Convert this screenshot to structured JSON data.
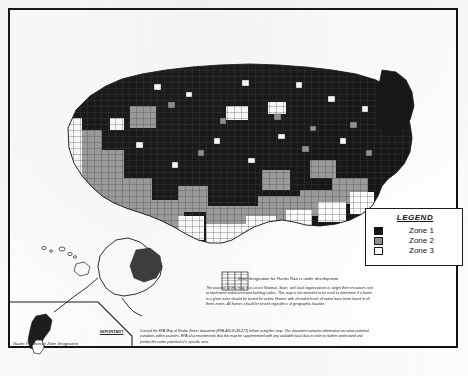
{
  "document": {
    "kind": "scanned-map-page",
    "title_visible": false
  },
  "legend": {
    "title": "LEGEND",
    "entries": [
      {
        "label": "Zone 1",
        "swatch": "black",
        "color": "#141414"
      },
      {
        "label": "Zone 2",
        "swatch": "gray",
        "color": "#8e8e8e"
      },
      {
        "label": "Zone 3",
        "swatch": "white",
        "color": "#ffffff"
      }
    ]
  },
  "annotations": {
    "puerto_rico_note": "Zone designation for Puerto Rico is under development",
    "purpose": "The purpose of this map is to assist National, State, and local organizations to target their resources and to implement radon-resistant building codes. This map is not intended to be used to determine if a home in a given zone should be tested for radon. Homes with elevated levels of radon have been found in all three zones. All homes should be tested regardless of geographic location.",
    "important_tag": "IMPORTANT",
    "important_text": "Consult the EPA Map of Radon Zones document (EPA-402-R-93-071) before using this map. This document contains information on radon potential variations within counties. EPA also recommends that this map be supplemented with any available local data in order to further understand and predict the radon potential of a specific area.",
    "guam_caption": "Guam:  Preliminary Zone designation"
  },
  "insets": [
    {
      "name": "alaska"
    },
    {
      "name": "hawaii"
    },
    {
      "name": "puerto-rico"
    },
    {
      "name": "guam"
    }
  ]
}
